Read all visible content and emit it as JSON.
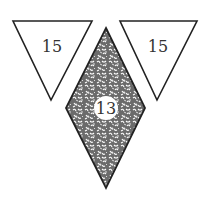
{
  "shapes": {
    "left_triangle": {
      "label": "15",
      "fill": "#ffffff",
      "stroke": "#222222"
    },
    "right_triangle": {
      "label": "15",
      "fill": "#ffffff",
      "stroke": "#222222"
    },
    "center_diamond": {
      "label": "13",
      "fill": "#6b6b6b",
      "pattern": "white-squiggle",
      "stroke": "#222222"
    }
  }
}
